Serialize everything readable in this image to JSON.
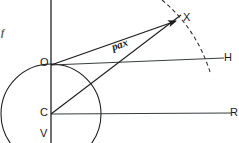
{
  "figure": {
    "type": "geometric-vector-diagram",
    "width": 239,
    "height": 143,
    "background_color": "#ffffff",
    "ink_color": "#1a1a1a",
    "faint_ink_color": "#55595c"
  },
  "labels": {
    "origin": "O",
    "center": "C",
    "vertical_bottom": "V",
    "target_point": "X",
    "horizon_right": "H",
    "baseline_right": "R",
    "vector": "pax",
    "left_edge_mark": "f"
  },
  "points": {
    "O": {
      "x": 51,
      "y": 64
    },
    "C": {
      "x": 51,
      "y": 114
    },
    "V": {
      "x": 51,
      "y": 140
    },
    "X": {
      "x": 177,
      "y": 20
    },
    "H_end": {
      "x": 224,
      "y": 58
    },
    "R_end": {
      "x": 231,
      "y": 113
    }
  },
  "geometry": {
    "vertical_axis": {
      "x": 51,
      "y_top": 0,
      "y_bottom": 143
    },
    "circle": {
      "cx": 51,
      "cy": 114,
      "r": 50
    },
    "line_O_to_H": {
      "x1": 51,
      "y1": 65,
      "x2": 224,
      "y2": 58
    },
    "line_C_to_R": {
      "x1": 51,
      "y1": 114,
      "x2": 231,
      "y2": 113
    },
    "vector_O_to_X": {
      "x1": 51,
      "y1": 65,
      "x2": 177,
      "y2": 20
    },
    "line_C_to_X": {
      "x1": 51,
      "y1": 114,
      "x2": 181,
      "y2": 15
    },
    "dashed_arc": {
      "start": {
        "x": 162,
        "y": 0
      },
      "control": {
        "x": 196,
        "y": 28
      },
      "end": {
        "x": 210,
        "y": 72
      },
      "dash_pattern": "4 3"
    }
  },
  "label_positions": {
    "O": {
      "left": 40,
      "top": 57
    },
    "C": {
      "left": 40,
      "top": 107
    },
    "V": {
      "left": 40,
      "top": 128
    },
    "X": {
      "left": 183,
      "top": 12
    },
    "H": {
      "left": 224,
      "top": 52
    },
    "R": {
      "left": 230,
      "top": 107
    },
    "vector": {
      "left": 112,
      "top": 42,
      "rotate_deg": -20
    },
    "left_edge_mark": {
      "left": 1,
      "top": 28
    }
  }
}
